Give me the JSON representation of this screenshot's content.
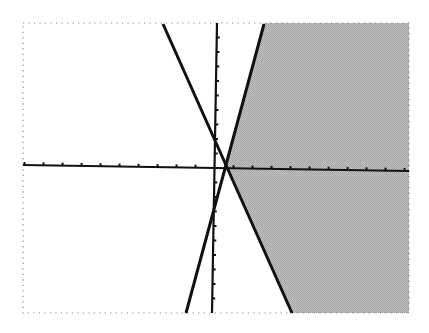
{
  "chart_data": {
    "type": "line",
    "title": "",
    "xlabel": "",
    "ylabel": "",
    "grid": false,
    "legend": null,
    "xlim": [
      -10,
      10
    ],
    "ylim": [
      -10,
      10
    ],
    "x_tick_step": 1,
    "y_tick_step": 1,
    "series": [
      {
        "name": "line-positive-slope",
        "points": [
          [
            2.5,
            10
          ],
          [
            -1.6,
            -10
          ]
        ]
      },
      {
        "name": "line-negative-slope",
        "points": [
          [
            -2.8,
            10
          ],
          [
            4,
            -10
          ]
        ]
      }
    ],
    "shaded_region": {
      "description": "right of both lines",
      "color": "#b4b4b4"
    },
    "colors": {
      "line": "#111111",
      "axis": "#111111",
      "shade": "#b4b4b4",
      "frame": "#888888",
      "background": "#ffffff"
    }
  },
  "frame": {
    "left": 23,
    "top": 23,
    "right": 409,
    "bottom": 313
  },
  "pixels": {
    "axis_x_y_left": 165,
    "axis_x_y_right": 171,
    "axis_y_x_top": 217,
    "axis_y_x_bottom": 212,
    "line_pos": {
      "x1": 264,
      "y1": 24,
      "x2": 186,
      "y2": 313
    },
    "line_neg": {
      "x1": 163,
      "y1": 24,
      "x2": 292,
      "y2": 313
    },
    "x_tick_spacing": 19,
    "y_tick_spacing": 14.5
  }
}
